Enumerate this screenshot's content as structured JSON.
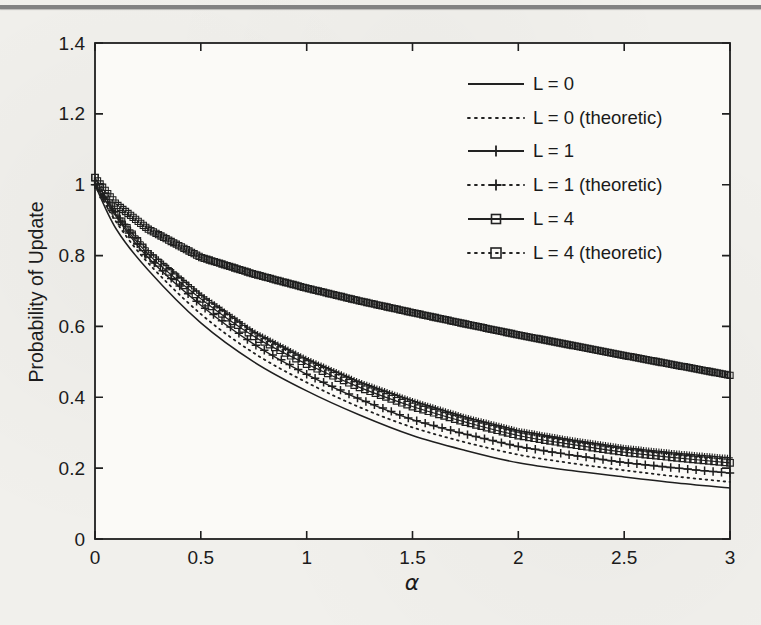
{
  "page": {
    "background": "#f1f0ec",
    "top_rule_color": "#828282"
  },
  "chart_data": {
    "type": "line",
    "title": "",
    "xlabel": "α",
    "ylabel": "Probability of Update",
    "xlim": [
      0,
      3
    ],
    "ylim": [
      0,
      1.4
    ],
    "grid": false,
    "legend_position": "upper right",
    "x_tick_values": [
      0,
      0.5,
      1,
      1.5,
      2,
      2.5,
      3
    ],
    "x_tick_labels": [
      "0",
      "0.5",
      "1",
      "1.5",
      "2",
      "2.5",
      "3"
    ],
    "y_tick_values": [
      0,
      0.2,
      0.4,
      0.6,
      0.8,
      1,
      1.2,
      1.4
    ],
    "y_tick_labels": [
      "0",
      "0.2",
      "0.4",
      "0.6",
      "0.8",
      "1",
      "1.2",
      "1.4"
    ],
    "x": [
      0,
      0.1,
      0.25,
      0.5,
      0.75,
      1.0,
      1.25,
      1.5,
      1.75,
      2.0,
      2.25,
      2.5,
      2.75,
      3.0
    ],
    "series": [
      {
        "name": "L = 0",
        "line": "solid",
        "marker": "none",
        "marker_step": 0,
        "values": [
          1.0,
          0.875,
          0.76,
          0.61,
          0.5,
          0.418,
          0.35,
          0.292,
          0.25,
          0.215,
          0.193,
          0.175,
          0.158,
          0.144
        ]
      },
      {
        "name": "L = 0 (theoretic)",
        "line": "dotted",
        "marker": "none",
        "marker_step": 0,
        "values": [
          1.0,
          0.895,
          0.78,
          0.635,
          0.525,
          0.442,
          0.372,
          0.315,
          0.273,
          0.238,
          0.214,
          0.194,
          0.176,
          0.161
        ]
      },
      {
        "name": "L = 1",
        "line": "solid",
        "marker": "plus",
        "marker_step": 0.04,
        "values": [
          1.0,
          0.91,
          0.795,
          0.66,
          0.55,
          0.465,
          0.395,
          0.337,
          0.296,
          0.261,
          0.237,
          0.216,
          0.2,
          0.186
        ]
      },
      {
        "name": "L = 1 (theoretic)",
        "line": "dotted",
        "marker": "plus",
        "marker_step": 0.012,
        "values": [
          1.0,
          0.92,
          0.815,
          0.69,
          0.585,
          0.508,
          0.443,
          0.39,
          0.344,
          0.306,
          0.28,
          0.258,
          0.242,
          0.229
        ]
      },
      {
        "name": "L = 4",
        "line": "solid",
        "marker": "square",
        "marker_step": 0.025,
        "values": [
          1.02,
          0.915,
          0.805,
          0.678,
          0.572,
          0.494,
          0.428,
          0.374,
          0.33,
          0.292,
          0.267,
          0.245,
          0.229,
          0.215
        ]
      },
      {
        "name": "L = 4 (theoretic)",
        "line": "dotted",
        "marker": "square",
        "marker_step": 0.012,
        "values": [
          1.02,
          0.945,
          0.875,
          0.795,
          0.748,
          0.708,
          0.672,
          0.639,
          0.607,
          0.576,
          0.547,
          0.518,
          0.49,
          0.462
        ]
      }
    ]
  }
}
